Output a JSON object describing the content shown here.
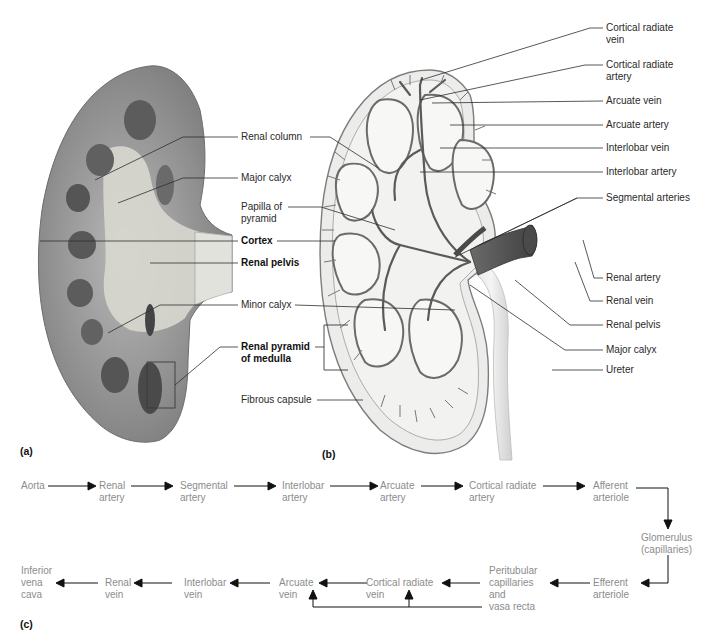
{
  "figure": {
    "panel_a": {
      "letter": "(a)",
      "labels": {
        "renal_column": "Renal column",
        "major_calyx": "Major calyx",
        "papilla_line1": "Papilla of",
        "papilla_line2": "pyramid",
        "cortex": "Cortex",
        "renal_pelvis": "Renal pelvis",
        "minor_calyx": "Minor calyx",
        "renal_pyramid_line1": "Renal pyramid",
        "renal_pyramid_line2": "of medulla",
        "fibrous_capsule": "Fibrous capsule"
      }
    },
    "panel_b": {
      "letter": "(b)",
      "labels": {
        "cortical_radiate_vein_1": "Cortical radiate",
        "cortical_radiate_vein_2": "vein",
        "cortical_radiate_artery_1": "Cortical radiate",
        "cortical_radiate_artery_2": "artery",
        "arcuate_vein": "Arcuate vein",
        "arcuate_artery": "Arcuate artery",
        "interlobar_vein": "Interlobar vein",
        "interlobar_artery": "Interlobar artery",
        "segmental_arteries": "Segmental arteries",
        "renal_artery": "Renal artery",
        "renal_vein": "Renal vein",
        "renal_pelvis": "Renal pelvis",
        "major_calyx": "Major calyx",
        "ureter": "Ureter"
      }
    },
    "panel_c": {
      "letter": "(c)",
      "arterial_path": [
        {
          "l1": "Aorta",
          "l2": ""
        },
        {
          "l1": "Renal",
          "l2": "artery"
        },
        {
          "l1": "Segmental",
          "l2": "artery"
        },
        {
          "l1": "Interlobar",
          "l2": "artery"
        },
        {
          "l1": "Arcuate",
          "l2": "artery"
        },
        {
          "l1": "Cortical radiate",
          "l2": "artery"
        },
        {
          "l1": "Afferent",
          "l2": "arteriole"
        }
      ],
      "glomerulus": {
        "l1": "Glomerulus",
        "l2": "(capillaries)"
      },
      "venous_path": [
        {
          "l1": "Efferent",
          "l2": "arteriole"
        },
        {
          "l1": "Peritubular",
          "l2": "capillaries",
          "l3": "and",
          "l4": "vasa recta"
        },
        {
          "l1": "Cortical radiate",
          "l2": "vein"
        },
        {
          "l1": "Arcuate",
          "l2": "vein"
        },
        {
          "l1": "Interlobar",
          "l2": "vein"
        },
        {
          "l1": "Renal",
          "l2": "vein"
        },
        {
          "l1": "Inferior",
          "l2": "vena",
          "l3": "cava"
        }
      ]
    }
  },
  "colors": {
    "flow_text": "#8c8c8c",
    "label_text": "#2a2a2a",
    "kidney_photo_cortex": "#8a8a8a",
    "kidney_photo_medulla": "#5a5a5a",
    "kidney_drawing_vessels": "#6b6b6b"
  }
}
